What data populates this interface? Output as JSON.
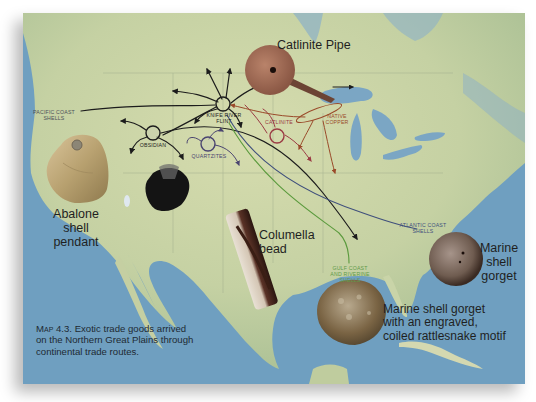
{
  "caption": {
    "figure_label": "Map 4.3.",
    "text_line1": "Exotic trade goods arrived",
    "text_line2": "on the Northern Great Plains through",
    "text_line3": "continental trade routes."
  },
  "artifacts": {
    "catlinite_pipe": "Catlinite Pipe",
    "abalone_line1": "Abalone",
    "abalone_line2": "shell",
    "abalone_line3": "pendant",
    "columella_line1": "Columella",
    "columella_line2": "bead",
    "marine_gorget_line1": "Marine",
    "marine_gorget_line2": "shell",
    "marine_gorget_line3": "gorget",
    "rattlesnake_line1": "Marine shell gorget",
    "rattlesnake_line2": "with an engraved,",
    "rattlesnake_line3": "coiled rattlesnake motif"
  },
  "sources": {
    "pacific_line1": "Pacific Coast",
    "pacific_line2": "Shells",
    "knife_line1": "Knife River",
    "knife_line2": "Flint",
    "obsidian": "Obsidian",
    "quartzites": "Quartzites",
    "catlinite": "Catlinite",
    "copper_line1": "Native",
    "copper_line2": "Copper",
    "atlantic_line1": "Atlantic Coast",
    "atlantic_line2": "Shells",
    "gulf_line1": "Gulf Coast",
    "gulf_line2": "and Riverine",
    "gulf_line3": "Shells"
  },
  "colors": {
    "ocean": "#6f9fc0",
    "land": "#c9d4a8",
    "route_black": "#1c1c1c",
    "route_catlinite": "#9b3a44",
    "route_copper": "#9a4a2a",
    "route_quartzite": "#4a4470",
    "route_atlantic": "#3f4f7c",
    "route_gulf": "#5a9a3c",
    "gulf_label": "#5f9a48",
    "atlantic_label": "#3f4f7c",
    "catlinite_label": "#9b3a44",
    "copper_label": "#9a4a2a",
    "quartzite_label": "#4a4470"
  }
}
